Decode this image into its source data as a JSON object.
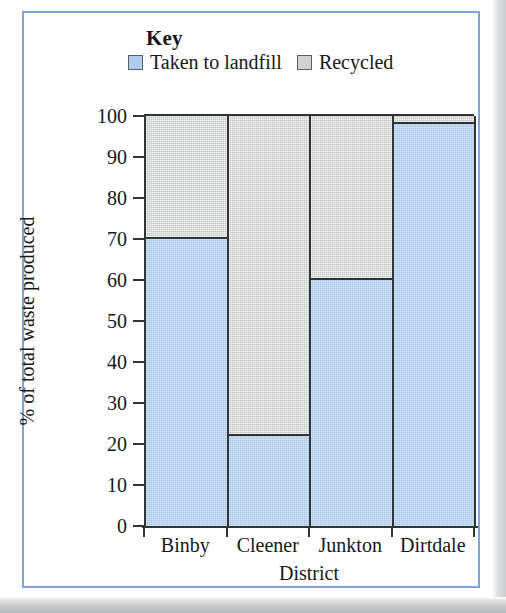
{
  "legend": {
    "title": "Key",
    "items": [
      {
        "label": "Taken to landfill",
        "color": "#aecdf0",
        "icon": "legend-swatch-blue"
      },
      {
        "label": "Recycled",
        "color": "#d0d2d2",
        "icon": "legend-swatch-grey"
      }
    ]
  },
  "chart_data": {
    "type": "bar",
    "stacked": true,
    "title": "",
    "xlabel": "District",
    "ylabel": "% of total waste produced",
    "categories": [
      "Binby",
      "Cleener",
      "Junkton",
      "Dirtdale"
    ],
    "series": [
      {
        "name": "Taken to landfill",
        "color": "#aecdf0",
        "values": [
          70,
          22,
          60,
          98
        ]
      },
      {
        "name": "Recycled",
        "color": "#d0d2d2",
        "values": [
          30,
          78,
          40,
          2
        ]
      }
    ],
    "ylim": [
      0,
      100
    ],
    "ytick_step": 10,
    "yticks": [
      100,
      90,
      80,
      70,
      60,
      50,
      40,
      30,
      20,
      10,
      0
    ],
    "ytick_labels": [
      "100",
      "90",
      "80",
      "70",
      "60",
      "50",
      "40",
      "30",
      "20",
      "10",
      "0"
    ],
    "grid": false,
    "legend_position": "top"
  },
  "theme": {
    "frame_color": "#7ba6dd",
    "axis_color": "#2f3437",
    "text_color": "#171717"
  }
}
